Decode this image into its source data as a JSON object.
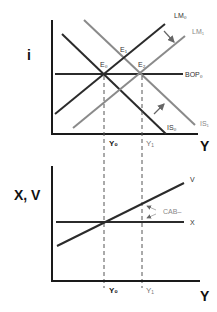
{
  "top_panel": {
    "y_axis_label": "i",
    "x_axis_label": "Y",
    "curves": {
      "LM0": "LM₀",
      "LM1": "LM₁",
      "BOP0": "BOP₀",
      "IS0": "IS₀",
      "IS1": "IS₁"
    },
    "points": {
      "E0": "E₀",
      "E1": "E₁",
      "E2": "E₂"
    },
    "ticks": {
      "Y0": "Y₀",
      "Y1": "Y₁"
    }
  },
  "bottom_panel": {
    "y_axis_label": "X, V",
    "x_axis_label": "Y",
    "curves": {
      "V": "V",
      "X": "X"
    },
    "annotation": "CAB–",
    "ticks": {
      "Y0": "Y₀",
      "Y1": "Y₁"
    }
  },
  "colors": {
    "dark_line": "#2b2b2b",
    "shifted_line": "#8a8a8a",
    "axis": "#1a1a1a"
  }
}
